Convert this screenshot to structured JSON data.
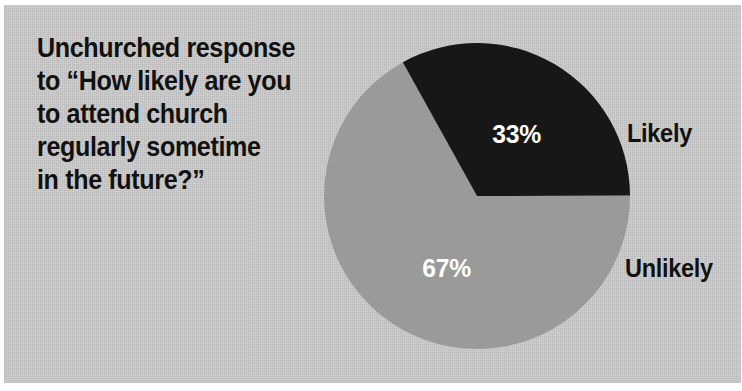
{
  "figure": {
    "width": 742,
    "height": 391,
    "background_color": "#cccccc",
    "page_color": "#ffffff"
  },
  "title": {
    "full_text": "Unchurched response to “How likely are you to attend church regularly sometime in the future?”",
    "lines": [
      "Unchurched response",
      "to “How likely are you",
      "to attend church",
      "regularly sometime",
      "in the future?”"
    ]
  },
  "chart_data": {
    "type": "pie",
    "title": "Unchurched response to “How likely are you to attend church regularly sometime in the future?”",
    "xlabel": "",
    "ylabel": "",
    "categories": [
      "Likely",
      "Unlikely"
    ],
    "values": [
      33,
      67
    ],
    "value_labels": [
      "33%",
      "67%"
    ],
    "units": "percent",
    "total": 100,
    "colors": [
      "#171717",
      "#9a9a9a"
    ],
    "label_text_colors": [
      "#ffffff",
      "#ffffff"
    ],
    "category_text_color": "#111111",
    "legend": "outside-right-of-slice",
    "grid": false,
    "start_angle_deg": -29,
    "direction": "clockwise",
    "geometry": {
      "center_x": 473,
      "center_y": 191,
      "radius": 153
    },
    "slices": [
      {
        "name": "Likely",
        "value": 33,
        "value_label": "33%",
        "color": "#171717",
        "sweep_deg": 118.8,
        "start_deg": -29,
        "end_deg": 89.8
      },
      {
        "name": "Unlikely",
        "value": 67,
        "value_label": "67%",
        "color": "#9a9a9a",
        "sweep_deg": 241.2,
        "start_deg": 89.8,
        "end_deg": 331
      }
    ]
  }
}
